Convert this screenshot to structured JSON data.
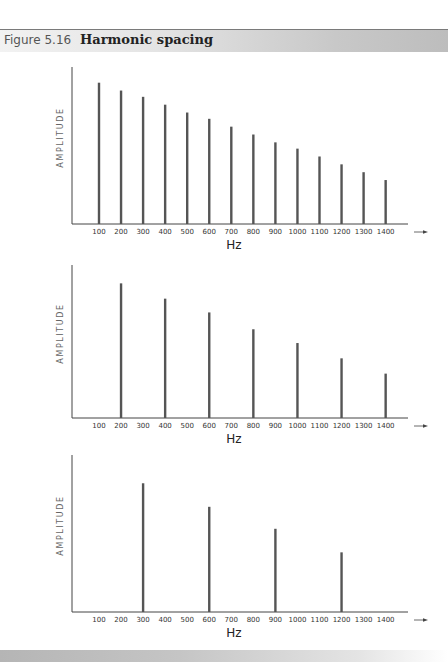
{
  "header": {
    "figure_number": "Figure 5.16",
    "title": "Harmonic spacing"
  },
  "colors": {
    "bar": "#555555",
    "axis": "#444444",
    "header_rule": "#7a7a7a"
  },
  "chart_data": [
    {
      "type": "bar",
      "title": "Harmonic spacing — fundamental 100 Hz",
      "xlabel": "Hz",
      "ylabel": "AMPLITUDE",
      "categories": [
        "100",
        "200",
        "300",
        "400",
        "500",
        "600",
        "700",
        "800",
        "900",
        "1000",
        "1100",
        "1200",
        "1300",
        "1400"
      ],
      "x": [
        100,
        200,
        300,
        400,
        500,
        600,
        700,
        800,
        900,
        1000,
        1100,
        1200,
        1300,
        1400
      ],
      "values": [
        90,
        85,
        81,
        76,
        71,
        67,
        62,
        57,
        52,
        48,
        43,
        38,
        33,
        28
      ],
      "ylim": [
        0,
        100
      ],
      "grid": false,
      "notes": "Relative amplitudes (arbitrary units); x-axis ends with arrow"
    },
    {
      "type": "bar",
      "title": "Harmonic spacing — fundamental 200 Hz",
      "xlabel": "Hz",
      "ylabel": "AMPLITUDE",
      "categories": [
        "100",
        "200",
        "300",
        "400",
        "500",
        "600",
        "700",
        "800",
        "900",
        "1000",
        "1100",
        "1200",
        "1300",
        "1400"
      ],
      "x": [
        200,
        400,
        600,
        800,
        1000,
        1200,
        1400
      ],
      "values": [
        88,
        78,
        69,
        58,
        49,
        39,
        29
      ],
      "ylim": [
        0,
        100
      ],
      "grid": false,
      "notes": "Relative amplitudes (arbitrary units)"
    },
    {
      "type": "bar",
      "title": "Harmonic spacing — fundamental 300 Hz",
      "xlabel": "Hz",
      "ylabel": "AMPLITUDE",
      "categories": [
        "100",
        "200",
        "300",
        "400",
        "500",
        "600",
        "700",
        "800",
        "900",
        "1000",
        "1100",
        "1200",
        "1300",
        "1400"
      ],
      "x": [
        300,
        600,
        900,
        1200
      ],
      "values": [
        82,
        67,
        53,
        38
      ],
      "ylim": [
        0,
        100
      ],
      "grid": false,
      "notes": "Relative amplitudes (arbitrary units)"
    }
  ]
}
